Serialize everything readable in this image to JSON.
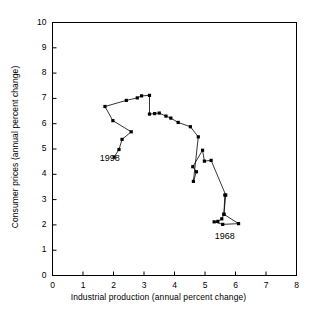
{
  "chart_data": {
    "type": "scatter",
    "title": "",
    "xlabel": "Industrial production (annual percent change)",
    "ylabel": "Consumer prices (annual percent change)",
    "xlim": [
      0,
      8
    ],
    "ylim": [
      0,
      10
    ],
    "xticks": [
      "0",
      "1",
      "2",
      "3",
      "4",
      "5",
      "6",
      "7",
      "8"
    ],
    "yticks": [
      "0",
      "1",
      "2",
      "3",
      "4",
      "5",
      "6",
      "7",
      "8",
      "9",
      "10"
    ],
    "grid": false,
    "legend": false,
    "connected": true,
    "marker": "filled-square",
    "series": [
      {
        "name": "Industrial production vs Consumer prices",
        "points": [
          [
            5.65,
            3.18
          ],
          [
            5.62,
            2.42
          ],
          [
            6.1,
            2.05
          ],
          [
            5.58,
            2.02
          ],
          [
            5.3,
            2.12
          ],
          [
            5.42,
            2.14
          ],
          [
            5.55,
            2.24
          ],
          [
            5.62,
            2.42
          ],
          [
            5.68,
            3.18
          ],
          [
            5.2,
            4.55
          ],
          [
            4.98,
            4.52
          ],
          [
            4.92,
            4.95
          ],
          [
            4.6,
            4.3
          ],
          [
            4.72,
            4.1
          ],
          [
            4.62,
            3.72
          ],
          [
            4.78,
            5.48
          ],
          [
            4.52,
            5.88
          ],
          [
            4.12,
            6.05
          ],
          [
            3.88,
            6.22
          ],
          [
            3.72,
            6.3
          ],
          [
            3.5,
            6.42
          ],
          [
            3.35,
            6.4
          ],
          [
            3.18,
            6.38
          ],
          [
            3.18,
            7.12
          ],
          [
            2.92,
            7.1
          ],
          [
            2.78,
            7.02
          ],
          [
            2.42,
            6.92
          ],
          [
            1.72,
            6.68
          ],
          [
            1.98,
            6.12
          ],
          [
            2.58,
            5.68
          ],
          [
            2.28,
            5.38
          ],
          [
            2.18,
            4.98
          ],
          [
            2.02,
            4.68
          ]
        ]
      }
    ],
    "annotations": [
      {
        "text": "1998",
        "x": 1.55,
        "y": 4.62
      },
      {
        "text": "1968",
        "x": 5.32,
        "y": 1.52
      }
    ]
  },
  "axes": {
    "x_title": "Industrial production (annual percent change)",
    "y_title": "Consumer prices (annual percent change)"
  },
  "labels": {
    "label_1998": "1998",
    "label_1968": "1968"
  },
  "colors": {
    "axis": "#000000",
    "line": "#000000",
    "marker": "#000000",
    "background": "#ffffff"
  }
}
